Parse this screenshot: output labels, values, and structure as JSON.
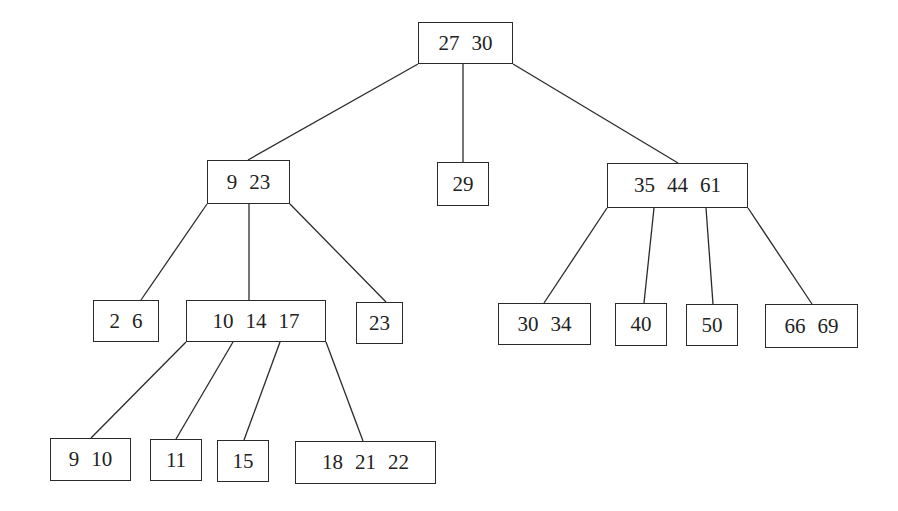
{
  "diagram": {
    "type": "b-tree",
    "line_color": "#2a2a2a",
    "nodes": [
      {
        "id": "root",
        "keys": [
          "27",
          "30"
        ],
        "box": [
          418,
          22,
          95,
          42
        ]
      },
      {
        "id": "n9_23",
        "keys": [
          "9",
          "23"
        ],
        "box": [
          207,
          160,
          83,
          44
        ]
      },
      {
        "id": "n29",
        "keys": [
          "29"
        ],
        "box": [
          437,
          162,
          52,
          44
        ]
      },
      {
        "id": "n35_44_61",
        "keys": [
          "35",
          "44",
          "61"
        ],
        "box": [
          607,
          163,
          141,
          45
        ]
      },
      {
        "id": "n2_6",
        "keys": [
          "2",
          "6"
        ],
        "box": [
          93,
          300,
          66,
          42
        ]
      },
      {
        "id": "n10_14_17",
        "keys": [
          "10",
          "14",
          "17"
        ],
        "box": [
          186,
          300,
          140,
          42
        ]
      },
      {
        "id": "n23",
        "keys": [
          "23"
        ],
        "box": [
          356,
          302,
          47,
          42
        ]
      },
      {
        "id": "n30_34",
        "keys": [
          "30",
          "34"
        ],
        "box": [
          498,
          303,
          93,
          42
        ]
      },
      {
        "id": "n40",
        "keys": [
          "40"
        ],
        "box": [
          615,
          303,
          52,
          43
        ]
      },
      {
        "id": "n50",
        "keys": [
          "50"
        ],
        "box": [
          686,
          304,
          52,
          42
        ]
      },
      {
        "id": "n66_69",
        "keys": [
          "66",
          "69"
        ],
        "box": [
          765,
          304,
          93,
          44
        ]
      },
      {
        "id": "n9_10",
        "keys": [
          "9",
          "10"
        ],
        "box": [
          50,
          438,
          81,
          43
        ]
      },
      {
        "id": "n11",
        "keys": [
          "11"
        ],
        "box": [
          150,
          439,
          52,
          42
        ]
      },
      {
        "id": "n15",
        "keys": [
          "15"
        ],
        "box": [
          217,
          440,
          52,
          42
        ]
      },
      {
        "id": "n18_21_22",
        "keys": [
          "18",
          "21",
          "22"
        ],
        "box": [
          295,
          441,
          141,
          43
        ]
      }
    ],
    "edges": [
      {
        "from": [
          418,
          64
        ],
        "to": [
          248,
          160
        ]
      },
      {
        "from": [
          463,
          64
        ],
        "to": [
          463,
          162
        ]
      },
      {
        "from": [
          513,
          64
        ],
        "to": [
          678,
          163
        ]
      },
      {
        "from": [
          207,
          204
        ],
        "to": [
          141,
          300
        ]
      },
      {
        "from": [
          249,
          204
        ],
        "to": [
          249,
          300
        ]
      },
      {
        "from": [
          290,
          204
        ],
        "to": [
          386,
          302
        ]
      },
      {
        "from": [
          607,
          208
        ],
        "to": [
          544,
          303
        ]
      },
      {
        "from": [
          654,
          208
        ],
        "to": [
          644,
          303
        ]
      },
      {
        "from": [
          706,
          208
        ],
        "to": [
          713,
          304
        ]
      },
      {
        "from": [
          748,
          208
        ],
        "to": [
          812,
          304
        ]
      },
      {
        "from": [
          186,
          342
        ],
        "to": [
          91,
          438
        ]
      },
      {
        "from": [
          233,
          342
        ],
        "to": [
          176,
          439
        ]
      },
      {
        "from": [
          280,
          342
        ],
        "to": [
          244,
          440
        ]
      },
      {
        "from": [
          326,
          342
        ],
        "to": [
          363,
          441
        ]
      }
    ]
  }
}
